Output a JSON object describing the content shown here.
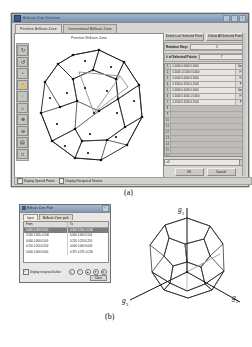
{
  "figure": {
    "label_a": "(a)",
    "label_b": "(b)"
  },
  "app": {
    "title": "Brillouin Zone Selection",
    "titlebar_buttons": [
      "_",
      "□",
      "×"
    ],
    "tabs": [
      {
        "label": "Primitive Brillouin Zone",
        "active": true
      },
      {
        "label": "Conventional Brillouin Zone",
        "active": false
      }
    ],
    "plot_title": "Primitive Brillouin Zone",
    "toolbar": [
      {
        "name": "rotate-3d-tool",
        "glyph": "↻"
      },
      {
        "name": "rotate-left-tool",
        "glyph": "↺"
      },
      {
        "name": "orbit-tool",
        "glyph": "◔"
      },
      {
        "name": "hand-pan-tool",
        "glyph": "✋"
      },
      {
        "name": "reset-view-tool",
        "glyph": "◌"
      },
      {
        "name": "camera-tool",
        "glyph": "⌂"
      },
      {
        "name": "zoom-in-tool",
        "glyph": "⊕"
      },
      {
        "name": "zoom-out-tool",
        "glyph": "⊖"
      },
      {
        "name": "measure-tool",
        "glyph": "▤"
      },
      {
        "name": "save-image-tool",
        "glyph": "□"
      }
    ],
    "controls": {
      "delete_last_label": "Delete Last Selected Point",
      "delete_all_label": "Delete All Selected Points",
      "rotation_step_label": "Rotation Step:",
      "rotation_step_value": "5",
      "num_points_label": "# of Selected Points:",
      "num_points_value": "7"
    },
    "points_table": [
      {
        "idx": "1",
        "value": "0.0000  0.0000  0.0000",
        "tag": "Gam"
      },
      {
        "idx": "2",
        "value": "0.5000 -0.5000  0.5000",
        "tag": "H"
      },
      {
        "idx": "3",
        "value": "0.0000  0.0000  0.5000",
        "tag": "N"
      },
      {
        "idx": "4",
        "value": "0.2500  0.2500  0.2500",
        "tag": "P"
      },
      {
        "idx": "5",
        "value": "0.0000  0.0000  0.0000",
        "tag": "Gam"
      },
      {
        "idx": "6",
        "value": "0.5000  0.5000 -0.5000",
        "tag": "H"
      },
      {
        "idx": "7",
        "value": "0.2500  0.2500  0.2500",
        "tag": "P"
      },
      {
        "idx": "8",
        "value": "",
        "tag": ""
      },
      {
        "idx": "9",
        "value": "",
        "tag": ""
      },
      {
        "idx": "10",
        "value": "",
        "tag": ""
      },
      {
        "idx": "11",
        "value": "",
        "tag": ""
      },
      {
        "idx": "12",
        "value": "",
        "tag": ""
      },
      {
        "idx": "13",
        "value": "",
        "tag": ""
      },
      {
        "idx": "14",
        "value": "",
        "tag": ""
      },
      {
        "idx": "15",
        "value": "",
        "tag": ""
      },
      {
        "idx": "16",
        "value": "",
        "tag": ""
      }
    ],
    "combo_value": "all",
    "combo_arrow": "▼",
    "ok_label": "OK",
    "cancel_label": "Cancel",
    "status": {
      "special_points_label": "Display Special Points",
      "special_points_checked": "✓",
      "reciprocal_vectors_label": "Display Reciprocal Vectors",
      "reciprocal_vectors_checked": ""
    }
  },
  "dialog": {
    "title": "Brillouin Zone Path",
    "close_label": "×",
    "tabs": [
      {
        "label": "Input",
        "active": true
      },
      {
        "label": "Brillouin Zone path",
        "active": false
      }
    ],
    "columns": [
      "From",
      "To"
    ],
    "rows": [
      {
        "from": "0.000  0.000  0.000",
        "to": "0.500  0.500 -0.500",
        "selected": true
      },
      {
        "from": "0.500  0.500 -0.500",
        "to": "0.000  0.000  0.500",
        "selected": false
      },
      {
        "from": "0.000  0.000  0.500",
        "to": "0.250  0.250  0.250",
        "selected": false
      },
      {
        "from": "0.250  0.250  0.250",
        "to": "0.000  0.000  0.000",
        "selected": false
      },
      {
        "from": "0.000  0.000  0.000",
        "to": "0.375  0.375 -0.250",
        "selected": false
      }
    ],
    "checkbox_label": "Display reciprocal lattice",
    "checkbox_checked": "✓",
    "icons": [
      {
        "name": "add-row-icon",
        "glyph": "+"
      },
      {
        "name": "remove-row-icon",
        "glyph": "−"
      },
      {
        "name": "move-up-icon",
        "glyph": "▲"
      },
      {
        "name": "move-down-icon",
        "glyph": "▼"
      },
      {
        "name": "settings-icon",
        "glyph": "⚙"
      }
    ],
    "close_button": "Close"
  },
  "polyhedron": {
    "vectors": [
      {
        "name": "g1",
        "symbol": "g",
        "sub": "1"
      },
      {
        "name": "g2",
        "symbol": "g",
        "sub": "2"
      },
      {
        "name": "g3",
        "symbol": "g",
        "sub": "3"
      }
    ]
  }
}
